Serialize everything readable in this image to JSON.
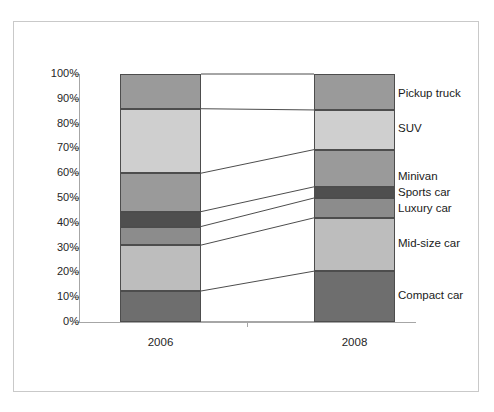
{
  "figure": {
    "background_color": "#ffffff",
    "frame_color": "#c9c9c9",
    "axis_color": "#a6a6a6",
    "segment_border_color": "#4d4d4d",
    "connector_color": "#4d4d4d"
  },
  "chart_data": {
    "type": "bar",
    "subtype": "100% stacked bar with band connectors",
    "title": "",
    "subtitle": "",
    "xlabel": "",
    "ylabel": "",
    "categories": [
      "2006",
      "2008"
    ],
    "ylim": [
      0,
      100
    ],
    "y_unit": "%",
    "grid": false,
    "legend_position": "right-inline",
    "y_tick_labels": [
      "0%",
      "10%",
      "20%",
      "30%",
      "40%",
      "50%",
      "60%",
      "70%",
      "80%",
      "90%",
      "100%"
    ],
    "y_tick_values": [
      0,
      10,
      20,
      30,
      40,
      50,
      60,
      70,
      80,
      90,
      100
    ],
    "stack_order_bottom_to_top": [
      "Compact car",
      "Mid-size car",
      "Luxury car",
      "Sports car",
      "Minivan",
      "SUV",
      "Pickup truck"
    ],
    "series": [
      {
        "name": "Compact car",
        "color": "#6e6e6e",
        "values": [
          12.5,
          20.5
        ],
        "cumulative_bottom": [
          0.0,
          0.0
        ],
        "cumulative_top": [
          12.5,
          20.5
        ]
      },
      {
        "name": "Mid-size car",
        "color": "#bdbdbd",
        "values": [
          18.5,
          21.5
        ],
        "cumulative_bottom": [
          12.5,
          20.5
        ],
        "cumulative_top": [
          31.0,
          42.0
        ]
      },
      {
        "name": "Luxury car",
        "color": "#8c8c8c",
        "values": [
          7.5,
          8.0
        ],
        "cumulative_bottom": [
          31.0,
          42.0
        ],
        "cumulative_top": [
          38.5,
          50.0
        ]
      },
      {
        "name": "Sports car",
        "color": "#4f4f4f",
        "values": [
          6.0,
          4.5
        ],
        "cumulative_bottom": [
          38.5,
          50.0
        ],
        "cumulative_top": [
          44.5,
          54.5
        ]
      },
      {
        "name": "Minivan",
        "color": "#9a9a9a",
        "values": [
          15.5,
          15.0
        ],
        "cumulative_bottom": [
          44.5,
          54.5
        ],
        "cumulative_top": [
          60.0,
          69.5
        ]
      },
      {
        "name": "SUV",
        "color": "#cfcfcf",
        "values": [
          26.0,
          16.0
        ],
        "cumulative_bottom": [
          60.0,
          69.5
        ],
        "cumulative_top": [
          86.0,
          85.5
        ]
      },
      {
        "name": "Pickup truck",
        "color": "#9a9a9a",
        "values": [
          14.0,
          14.5
        ],
        "cumulative_bottom": [
          86.0,
          85.5
        ],
        "cumulative_top": [
          100.0,
          100.0
        ]
      }
    ]
  },
  "series_labels": [
    {
      "text": "Pickup truck",
      "at_percent": 92.0
    },
    {
      "text": "SUV",
      "at_percent": 78.0
    },
    {
      "text": "Minivan",
      "at_percent": 58.5
    },
    {
      "text": "Sports car",
      "at_percent": 52.0
    },
    {
      "text": "Luxury car",
      "at_percent": 45.5
    },
    {
      "text": "Mid-size car",
      "at_percent": 31.5
    },
    {
      "text": "Compact car",
      "at_percent": 10.5
    }
  ]
}
